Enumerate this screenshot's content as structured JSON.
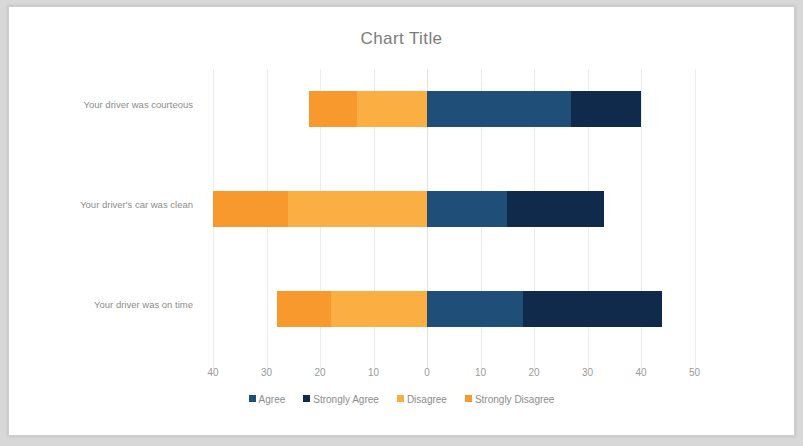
{
  "chart_data": {
    "type": "bar",
    "title": "Chart Title",
    "orientation": "horizontal",
    "stacked": "diverging",
    "xlabel": "",
    "ylabel": "",
    "grid": true,
    "legend_position": "bottom",
    "xlim": [
      -45,
      55
    ],
    "x_ticks": [
      {
        "label": "40",
        "value": -40
      },
      {
        "label": "30",
        "value": -30
      },
      {
        "label": "20",
        "value": -20
      },
      {
        "label": "10",
        "value": -10
      },
      {
        "label": "0",
        "value": 0
      },
      {
        "label": "10",
        "value": 10
      },
      {
        "label": "20",
        "value": 20
      },
      {
        "label": "30",
        "value": 30
      },
      {
        "label": "40",
        "value": 40
      },
      {
        "label": "50",
        "value": 50
      }
    ],
    "categories": [
      "Your driver was courteous",
      "Your driver's car was clean",
      "Your driver was on time"
    ],
    "series": [
      {
        "name": "Agree",
        "color": "#1f4e79",
        "values": [
          27,
          15,
          18
        ]
      },
      {
        "name": "Strongly Agree",
        "color": "#102a4c",
        "values": [
          13,
          18,
          26
        ]
      },
      {
        "name": "Disagree",
        "color": "#fbae42",
        "values": [
          13,
          26,
          18
        ]
      },
      {
        "name": "Strongly Disagree",
        "color": "#f8992e",
        "values": [
          9,
          14,
          10
        ]
      }
    ],
    "legend": [
      "Agree",
      "Strongly Agree",
      "Disagree",
      "Strongly Disagree"
    ]
  },
  "colors": {
    "agree": "#1f4e79",
    "strongly_agree": "#102a4c",
    "disagree": "#fbae42",
    "strongly_disagree": "#f8992e",
    "title_text": "#7b7b7b",
    "axis_text": "#9a9a9a",
    "gridline": "#ececec",
    "plot_background": "#ffffff",
    "page_background": "#d8d8d8"
  }
}
